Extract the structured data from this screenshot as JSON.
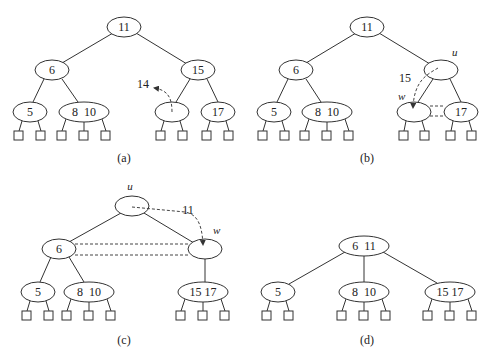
{
  "figure": {
    "panels": [
      {
        "id": "a",
        "caption": "(a)",
        "root": "11",
        "level1": [
          "6",
          "15"
        ],
        "leaves": [
          "5",
          "8  10",
          "",
          "17"
        ],
        "annotation": "14"
      },
      {
        "id": "b",
        "caption": "(b)",
        "root": "11",
        "level1": [
          "6",
          ""
        ],
        "leaves": [
          "5",
          "8  10",
          "",
          "17"
        ],
        "annotation": "15",
        "node_labels": {
          "u": "u",
          "w": "w"
        }
      },
      {
        "id": "c",
        "caption": "(c)",
        "root": "",
        "level1": [
          "6",
          ""
        ],
        "leaves": [
          "5",
          "8  10",
          "15 17"
        ],
        "annotation": "11",
        "node_labels": {
          "u": "u",
          "w": "w"
        }
      },
      {
        "id": "d",
        "caption": "(d)",
        "root": "6  11",
        "leaves": [
          "5",
          "8  10",
          "15 17"
        ]
      }
    ]
  }
}
